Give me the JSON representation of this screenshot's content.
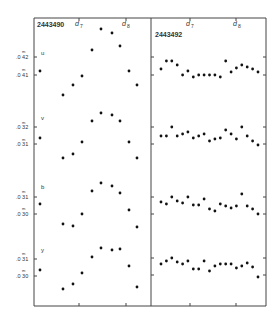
{
  "chart_data": {
    "type": "scatter",
    "title": "",
    "panels": [
      {
        "id": "left",
        "label": "2443490",
        "markers": [
          "d7",
          "d8"
        ],
        "bands": [
          {
            "name": "u",
            "ticks": [
              "0.42",
              "0.41"
            ],
            "y_px": [
              71,
              95,
              85,
              76,
              50,
              29,
              33,
              46,
              71,
              85
            ],
            "x_px": [
              40,
              63,
              73,
              82,
              92,
              101,
              112,
              120,
              129,
              137
            ]
          },
          {
            "name": "v",
            "ticks": [
              "0.32",
              "0.31"
            ],
            "y_px": [
              138,
              158,
              154,
              142,
              121,
              113,
              115,
              121,
              142,
              158
            ],
            "x_px": [
              40,
              63,
              73,
              82,
              92,
              101,
              112,
              120,
              129,
              137
            ]
          },
          {
            "name": "b",
            "ticks": [
              "0.31",
              "0.30"
            ],
            "y_px": [
              204,
              224,
              226,
              214,
              191,
              183,
              186,
              193,
              210,
              227
            ],
            "x_px": [
              40,
              63,
              73,
              82,
              92,
              101,
              112,
              120,
              129,
              137
            ]
          },
          {
            "name": "y",
            "ticks": [
              "0.31",
              "0.30"
            ],
            "y_px": [
              270,
              289,
              284,
              273,
              257,
              248,
              250,
              249,
              266,
              287
            ],
            "x_px": [
              40,
              63,
              73,
              82,
              92,
              101,
              112,
              120,
              129,
              137
            ]
          }
        ]
      },
      {
        "id": "right",
        "label": "2443492",
        "markers": [
          "d7",
          "d8"
        ],
        "bands": [
          {
            "name": "u",
            "y_px": [
              69,
              61,
              61,
              65,
              75,
              71,
              77,
              75,
              75,
              75,
              75,
              77,
              61,
              72,
              68,
              65,
              67,
              69,
              72
            ]
          },
          {
            "name": "v",
            "y_px": [
              136,
              136,
              127,
              136,
              134,
              132,
              138,
              136,
              134,
              141,
              139,
              138,
              130,
              134,
              139,
              127,
              136,
              141,
              145
            ]
          },
          {
            "name": "b",
            "y_px": [
              202,
              204,
              197,
              201,
              203,
              197,
              205,
              205,
              199,
              209,
              211,
              204,
              206,
              208,
              206,
              194,
              206,
              209,
              214
            ]
          },
          {
            "name": "y",
            "y_px": [
              264,
              261,
              258,
              262,
              264,
              261,
              269,
              269,
              261,
              271,
              266,
              264,
              264,
              264,
              268,
              266,
              263,
              267,
              277
            ]
          }
        ]
      }
    ],
    "xlabel": "",
    "ylabel": "magnitude (m)",
    "grid": false,
    "legend": "none"
  },
  "labels": {
    "left_id": "2443490",
    "right_id": "2443492",
    "d7": "d",
    "d7_sub": "7",
    "d8": "d",
    "d8_sub": "8",
    "band_u": "u",
    "band_v": "v",
    "band_b": "b",
    "band_y": "y",
    "tick_m": "m",
    "u_t1": ".0 42",
    "u_t2": ".0 41",
    "v_t1": ".0 32",
    "v_t2": ".0 31",
    "b_t1": ".0 31",
    "b_t2": ".0 30",
    "y_t1": ".0 31",
    "y_t2": ".0 30"
  }
}
